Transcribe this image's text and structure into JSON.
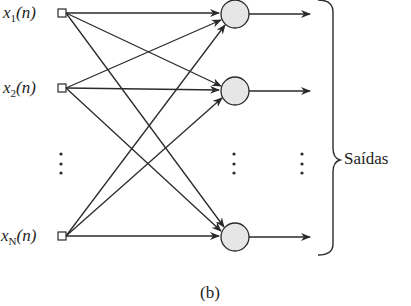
{
  "inputs": [
    {
      "var": "x",
      "sub": "1",
      "arg": "(n)"
    },
    {
      "var": "x",
      "sub": "2",
      "arg": "(n)"
    },
    {
      "var": "x",
      "sub": "N",
      "arg": "(n)"
    }
  ],
  "outputs_label": "Saídas",
  "caption": "(b)",
  "colors": {
    "line": "#2a2a2a",
    "neuron_fill": "#e6e6e6"
  }
}
